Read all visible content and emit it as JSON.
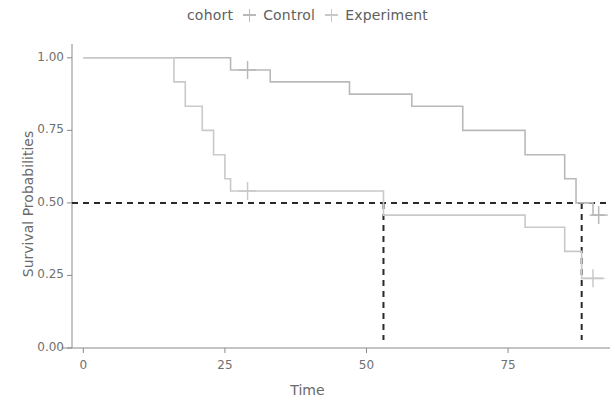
{
  "legend": {
    "title": "cohort",
    "entries": [
      {
        "label": "Control",
        "color": "#b9b9b9",
        "key_icon": "plus-marker-icon"
      },
      {
        "label": "Experiment",
        "color": "#c9c9c9",
        "key_icon": "plus-marker-icon"
      }
    ]
  },
  "axes": {
    "x_title": "Time",
    "y_title": "Survival Probabilities",
    "x_ticks": [
      "0",
      "25",
      "50",
      "75"
    ],
    "y_ticks": [
      "0.00",
      "0.25",
      "0.50",
      "0.75",
      "1.00"
    ]
  },
  "chart_data": {
    "type": "line",
    "title": "",
    "subtitle": "",
    "xlabel": "Time",
    "ylabel": "Survival Probabilities",
    "xlim": [
      -2,
      93
    ],
    "ylim": [
      0,
      1.02
    ],
    "x_ticks": [
      0,
      25,
      50,
      75
    ],
    "y_ticks": [
      0,
      0.25,
      0.5,
      0.75,
      1.0
    ],
    "grid": false,
    "legend_position": "top-center",
    "legend_title": "cohort",
    "style": "kaplan-meier step curves with censoring ticks and median reference lines",
    "series": [
      {
        "name": "Control",
        "color": "#b9b9b9",
        "step": "post",
        "points": [
          {
            "x": 0,
            "y": 1.0
          },
          {
            "x": 26,
            "y": 1.0
          },
          {
            "x": 26,
            "y": 0.958
          },
          {
            "x": 33,
            "y": 0.958
          },
          {
            "x": 33,
            "y": 0.917
          },
          {
            "x": 47,
            "y": 0.917
          },
          {
            "x": 47,
            "y": 0.875
          },
          {
            "x": 58,
            "y": 0.875
          },
          {
            "x": 58,
            "y": 0.833
          },
          {
            "x": 67,
            "y": 0.833
          },
          {
            "x": 67,
            "y": 0.75
          },
          {
            "x": 78,
            "y": 0.75
          },
          {
            "x": 78,
            "y": 0.666
          },
          {
            "x": 85,
            "y": 0.666
          },
          {
            "x": 85,
            "y": 0.583
          },
          {
            "x": 87,
            "y": 0.583
          },
          {
            "x": 87,
            "y": 0.5
          },
          {
            "x": 90,
            "y": 0.5
          },
          {
            "x": 90,
            "y": 0.458
          },
          {
            "x": 92,
            "y": 0.458
          }
        ],
        "censored": [
          {
            "x": 29,
            "y": 0.958
          },
          {
            "x": 91,
            "y": 0.458
          }
        ]
      },
      {
        "name": "Experiment",
        "color": "#c9c9c9",
        "step": "post",
        "points": [
          {
            "x": 0,
            "y": 1.0
          },
          {
            "x": 16,
            "y": 1.0
          },
          {
            "x": 16,
            "y": 0.917
          },
          {
            "x": 18,
            "y": 0.917
          },
          {
            "x": 18,
            "y": 0.833
          },
          {
            "x": 21,
            "y": 0.833
          },
          {
            "x": 21,
            "y": 0.75
          },
          {
            "x": 23,
            "y": 0.75
          },
          {
            "x": 23,
            "y": 0.666
          },
          {
            "x": 25,
            "y": 0.666
          },
          {
            "x": 25,
            "y": 0.583
          },
          {
            "x": 26,
            "y": 0.583
          },
          {
            "x": 26,
            "y": 0.541
          },
          {
            "x": 53,
            "y": 0.541
          },
          {
            "x": 53,
            "y": 0.458
          },
          {
            "x": 78,
            "y": 0.458
          },
          {
            "x": 78,
            "y": 0.416
          },
          {
            "x": 85,
            "y": 0.416
          },
          {
            "x": 85,
            "y": 0.333
          },
          {
            "x": 88,
            "y": 0.333
          },
          {
            "x": 88,
            "y": 0.24
          },
          {
            "x": 92,
            "y": 0.24
          }
        ],
        "censored": [
          {
            "x": 29,
            "y": 0.541
          },
          {
            "x": 90,
            "y": 0.24
          }
        ]
      }
    ],
    "reference_lines": [
      {
        "orientation": "horizontal",
        "value": 0.5,
        "style": "dashed",
        "color": "#2a2a2a"
      },
      {
        "orientation": "vertical",
        "value": 53,
        "style": "dashed",
        "color": "#2a2a2a",
        "label": "median-experiment"
      },
      {
        "orientation": "vertical",
        "value": 88,
        "style": "dashed",
        "color": "#2a2a2a",
        "label": "median-control"
      }
    ]
  }
}
